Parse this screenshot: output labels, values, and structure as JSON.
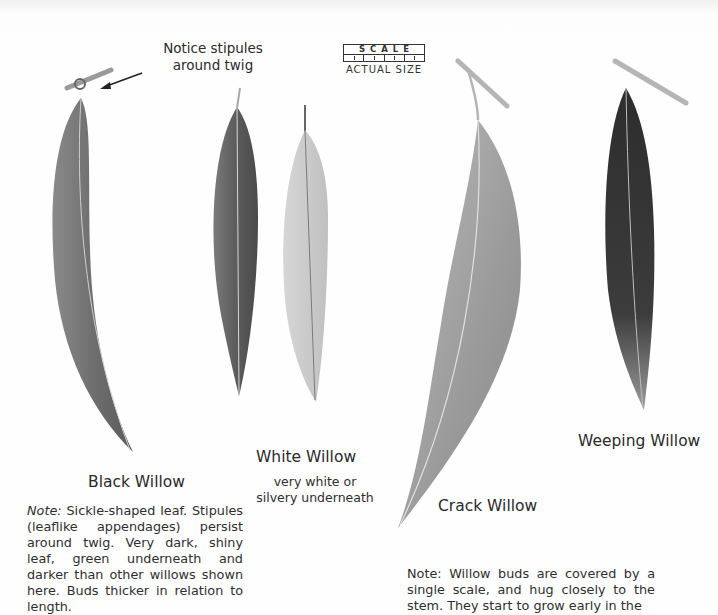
{
  "callout": {
    "line1": "Notice stipules",
    "line2": "around twig"
  },
  "scale": {
    "word": "SCALE",
    "label": "ACTUAL SIZE"
  },
  "leaves": [
    {
      "name": "Black Willow",
      "shade": "#7a7a7a"
    },
    {
      "name": "White Willow",
      "shade": "#666666",
      "underside_shade": "#c9c9c9"
    },
    {
      "name": "Crack Willow",
      "shade": "#a3a3a3"
    },
    {
      "name": "Weeping Willow",
      "shade": "#3a3a3a"
    }
  ],
  "captions": {
    "black_willow": "Black Willow",
    "white_willow": "White Willow",
    "white_willow_sub_line1": "very white or",
    "white_willow_sub_line2": "silvery underneath",
    "crack_willow": "Crack Willow",
    "weeping_willow": "Weeping Willow"
  },
  "notes": {
    "black_willow_prefix": "Note:",
    "black_willow_text": " Sickle-shaped leaf. Stipules (leaflike appendages) persist around twig. Very dark, shiny leaf, green underneath and darker than other willows shown here. Buds thicker in relation to length.",
    "buds_text": "Note: Willow buds are covered by a single scale, and hug closely to the stem. They start to grow early in the"
  }
}
